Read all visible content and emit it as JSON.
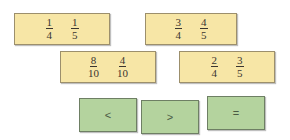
{
  "cards": [
    {
      "fractions": [
        {
          "num": "1",
          "den": "4"
        },
        {
          "num": "1",
          "den": "5"
        }
      ]
    },
    {
      "fractions": [
        {
          "num": "3",
          "den": "4"
        },
        {
          "num": "4",
          "den": "5"
        }
      ]
    },
    {
      "fractions": [
        {
          "num": "8",
          "den": "10"
        },
        {
          "num": "4",
          "den": "10"
        }
      ]
    },
    {
      "fractions": [
        {
          "num": "2",
          "den": "4"
        },
        {
          "num": "3",
          "den": "5"
        }
      ]
    }
  ],
  "buttons": {
    "less": "<",
    "greater": ">",
    "equal": "="
  },
  "colors": {
    "card_bg": "#f7e6a6",
    "button_bg": "#b4d39e"
  }
}
